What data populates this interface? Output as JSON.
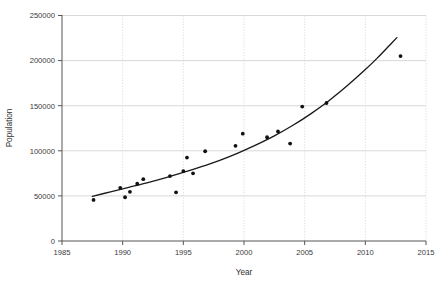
{
  "chart_data": {
    "type": "scatter",
    "title": "",
    "subtitle": "",
    "xlabel": "Year",
    "ylabel": "Population",
    "xlim": [
      1985,
      2015
    ],
    "ylim": [
      0,
      250000
    ],
    "xticks": [
      1985,
      1990,
      1995,
      2000,
      2005,
      2010,
      2015
    ],
    "xtick_labels": [
      "1985",
      "1990",
      "1995",
      "2000",
      "2005",
      "2010",
      "2015"
    ],
    "yticks": [
      0,
      50000,
      100000,
      150000,
      200000,
      250000
    ],
    "ytick_labels": [
      "0",
      "50000",
      "100000",
      "150000",
      "200000",
      "250000"
    ],
    "grid": "horizontal-solid-and-vertical-dotted",
    "legend": "none",
    "annotations": [],
    "series": [
      {
        "name": "Population observations",
        "type": "scatter",
        "marker": "filled-circle",
        "color": "#111111",
        "points": [
          {
            "x": 1987.6,
            "y": 45500
          },
          {
            "x": 1989.8,
            "y": 59000
          },
          {
            "x": 1990.2,
            "y": 48500
          },
          {
            "x": 1990.6,
            "y": 54500
          },
          {
            "x": 1991.2,
            "y": 63500
          },
          {
            "x": 1991.7,
            "y": 68500
          },
          {
            "x": 1993.9,
            "y": 72000
          },
          {
            "x": 1994.4,
            "y": 54000
          },
          {
            "x": 1995.0,
            "y": 77500
          },
          {
            "x": 1995.3,
            "y": 92500
          },
          {
            "x": 1995.8,
            "y": 75000
          },
          {
            "x": 1996.8,
            "y": 99500
          },
          {
            "x": 1999.3,
            "y": 105500
          },
          {
            "x": 1999.9,
            "y": 119000
          },
          {
            "x": 2001.9,
            "y": 115000
          },
          {
            "x": 2002.8,
            "y": 121500
          },
          {
            "x": 2003.8,
            "y": 108000
          },
          {
            "x": 2004.8,
            "y": 149000
          },
          {
            "x": 2006.8,
            "y": 153000
          },
          {
            "x": 2012.9,
            "y": 205000
          }
        ]
      },
      {
        "name": "Exponential fit curve",
        "type": "line",
        "color": "#1a1a1a",
        "points": [
          {
            "x": 1987.5,
            "y": 49500
          },
          {
            "x": 1989.0,
            "y": 54500
          },
          {
            "x": 1990.5,
            "y": 59500
          },
          {
            "x": 1992.0,
            "y": 64500
          },
          {
            "x": 1993.5,
            "y": 70000
          },
          {
            "x": 1995.0,
            "y": 76000
          },
          {
            "x": 1996.5,
            "y": 82500
          },
          {
            "x": 1998.0,
            "y": 89500
          },
          {
            "x": 1999.5,
            "y": 97500
          },
          {
            "x": 2001.0,
            "y": 106500
          },
          {
            "x": 2002.5,
            "y": 116500
          },
          {
            "x": 2004.0,
            "y": 128000
          },
          {
            "x": 2005.5,
            "y": 141000
          },
          {
            "x": 2007.0,
            "y": 155500
          },
          {
            "x": 2008.5,
            "y": 172000
          },
          {
            "x": 2010.0,
            "y": 190000
          },
          {
            "x": 2011.0,
            "y": 203000
          },
          {
            "x": 2012.0,
            "y": 217000
          },
          {
            "x": 2012.6,
            "y": 225500
          }
        ]
      }
    ]
  }
}
